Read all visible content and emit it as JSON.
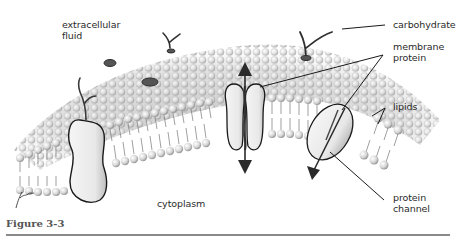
{
  "figure": {
    "caption": "Figure 3-3"
  },
  "labels": {
    "extracellular_fluid": "extracellular\nfluid",
    "carbohydrate": "carbohydrate",
    "membrane_protein": "membrane\nprotein",
    "lipids": "lipids",
    "cytoplasm": "cytoplasm",
    "protein_channel": "protein\nchannel"
  },
  "colors": {
    "background": "#ffffff",
    "lipid_head": "#d9d9d9",
    "lipid_shade": "#9a9a9a",
    "outline": "#1a1a1a",
    "label_text": "#2a2a2a",
    "caption_text": "#555555",
    "rule": "#8a8a8a"
  }
}
